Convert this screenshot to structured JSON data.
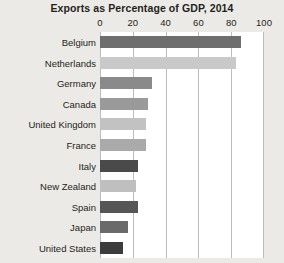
{
  "chart_data": {
    "type": "bar",
    "orientation": "horizontal",
    "title": "Exports as Percentage of GDP, 2014",
    "xlabel": "",
    "ylabel": "",
    "xlim": [
      0,
      100
    ],
    "xticks": [
      0,
      20,
      40,
      60,
      80,
      100
    ],
    "xtick_labels": [
      "0",
      "20",
      "40",
      "60",
      "80",
      "100"
    ],
    "grid": true,
    "legend": false,
    "categories": [
      "Belgium",
      "Netherlands",
      "Germany",
      "Canada",
      "United Kingdom",
      "France",
      "Italy",
      "New Zealand",
      "Spain",
      "Japan",
      "United States"
    ],
    "values": [
      86,
      83,
      32,
      29,
      28,
      28,
      23,
      22,
      23,
      17,
      14
    ],
    "bar_colors": [
      "#6e6e6e",
      "#c9c9c9",
      "#8a8a8a",
      "#9a9a9a",
      "#c2c2c2",
      "#aaaaaa",
      "#4a4a4a",
      "#bfbfbf",
      "#565656",
      "#6a6a6a",
      "#3c3c3c"
    ]
  },
  "style": {
    "plot_background": "#ffffff",
    "page_background": "#eceae6",
    "gridline_color": "#bcbcbc",
    "text_color": "#231f20"
  }
}
